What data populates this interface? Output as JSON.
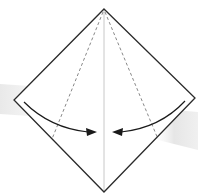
{
  "diagram": {
    "type": "origami-fold-step",
    "colors": {
      "outline": "#2a2a2a",
      "center_crease": "#c8c8c8",
      "dashed_fold": "#7a7a7a",
      "arrow": "#1a1a1a",
      "background_band": "#ececec"
    },
    "vertices": {
      "top": [
        104,
        9
      ],
      "left": [
        14,
        100
      ],
      "right": [
        195,
        98
      ],
      "bottom": [
        104,
        192
      ]
    },
    "fold_lines": [
      {
        "name": "left-valley-fold",
        "from": [
          104,
          9
        ],
        "to": [
          52,
          139
        ]
      },
      {
        "name": "right-valley-fold",
        "from": [
          104,
          9
        ],
        "to": [
          158,
          139
        ]
      }
    ],
    "arrows": [
      {
        "name": "left-fold-arrow",
        "direction": "right"
      },
      {
        "name": "right-fold-arrow",
        "direction": "left"
      }
    ]
  }
}
